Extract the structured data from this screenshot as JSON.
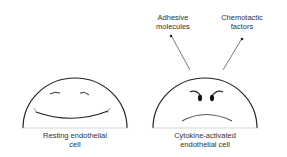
{
  "diagram": {
    "cells": [
      {
        "id": "resting",
        "label_line1": "Resting endothelial",
        "label_line2": "cell",
        "expression": "smile"
      },
      {
        "id": "activated",
        "label_line1": "Cytokine-activated",
        "label_line2": "endothelial cell",
        "expression": "frown",
        "outputs": [
          {
            "label_line1": "Adhesive",
            "label_line2": "molecules"
          },
          {
            "label_line1": "Chemotactic",
            "label_line2": "factors"
          }
        ]
      }
    ],
    "colors": {
      "line": "#222222",
      "text": "#333333",
      "background": "#ffffff"
    }
  }
}
